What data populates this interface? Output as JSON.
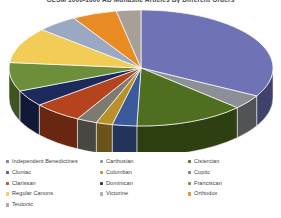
{
  "chart_data": {
    "type": "pie",
    "title": "GLSM 1000-1600 AD Monastic Articles By Different Orders",
    "xlabel": "",
    "ylabel": "",
    "legend_position": "bottom",
    "grid": false,
    "three_d": true,
    "categories": [
      "Independent Benedictines",
      "Carthusian",
      "Cistercian",
      "Cluniac",
      "Columban",
      "Coptic",
      "Clarissan",
      "Dominican",
      "Franciscan",
      "Regular Canons",
      "Victorine",
      "Orthodox",
      "Teutonic"
    ],
    "values": [
      33.0,
      4.0,
      13.5,
      3.0,
      2.0,
      2.5,
      6.0,
      4.5,
      8.0,
      10.0,
      5.0,
      5.5,
      3.0
    ],
    "colors": [
      "#6f72b5",
      "#8c9096",
      "#4f6e1f",
      "#3a5a9b",
      "#b8912b",
      "#7d7a72",
      "#b5441e",
      "#1f2a5c",
      "#6d8f3c",
      "#f2cc56",
      "#9aa8c4",
      "#e88b22",
      "#a8a097"
    ],
    "series": [
      {
        "name": "Monastic Articles",
        "values": [
          33.0,
          4.0,
          13.5,
          3.0,
          2.0,
          2.5,
          6.0,
          4.5,
          8.0,
          10.0,
          5.0,
          5.5,
          3.0
        ]
      }
    ]
  },
  "legend": {
    "columns": [
      {
        "items": [
          {
            "label": "Independent Benedictines",
            "color": "#6f72b5"
          },
          {
            "label": "Cluniac",
            "color": "#3a5a9b"
          },
          {
            "label": "Clarissan",
            "color": "#b5441e"
          },
          {
            "label": "Regular Canons",
            "color": "#f2cc56"
          },
          {
            "label": "Teutonic",
            "color": "#a8a097"
          }
        ]
      },
      {
        "items": [
          {
            "label": "Carthusian",
            "color": "#8c9096"
          },
          {
            "label": "Columban",
            "color": "#b8912b"
          },
          {
            "label": "Dominican",
            "color": "#1f2a5c"
          },
          {
            "label": "Victorine",
            "color": "#9aa8c4"
          }
        ]
      },
      {
        "items": [
          {
            "label": "Cistercian",
            "color": "#4f6e1f"
          },
          {
            "label": "Coptic",
            "color": "#7d7a72"
          },
          {
            "label": "Franciscan",
            "color": "#6d8f3c"
          },
          {
            "label": "Orthodox",
            "color": "#e88b22"
          }
        ]
      }
    ]
  }
}
